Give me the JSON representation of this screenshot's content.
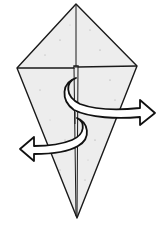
{
  "diagram": {
    "type": "origami-fold-step",
    "description": "Kite base with squash folds: two curved arrows showing flaps rotated right (front) and left (behind)",
    "colors": {
      "paper_fill": "#ededed",
      "outline": "#1a1a1a",
      "arrow_fill": "#ffffff",
      "background": "#ffffff"
    },
    "shape": {
      "top_apex": [
        76,
        4
      ],
      "left_corner": [
        17,
        68
      ],
      "right_corner": [
        137,
        66
      ],
      "bottom_tip": [
        77,
        218
      ]
    },
    "arrows": [
      {
        "name": "fold-right-arrow",
        "direction": "right",
        "tip": [
          155,
          112
        ]
      },
      {
        "name": "fold-left-arrow",
        "direction": "left",
        "tip": [
          20,
          148
        ]
      }
    ]
  }
}
